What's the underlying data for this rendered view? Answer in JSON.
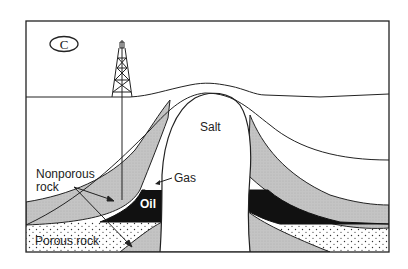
{
  "diagram": {
    "panel_label": "C",
    "labels": {
      "salt": "Salt",
      "gas": "Gas",
      "oil": "Oil",
      "nonporous_rock_line1": "Nonporous",
      "nonporous_rock_line2": "rock",
      "porous_rock": "Porous rock"
    },
    "colors": {
      "outline": "#222222",
      "nonporous_fill": "#c8c8c8",
      "oil_fill": "#111111",
      "porous_fill": "#ffffff",
      "porous_dots": "#333333",
      "background": "#ffffff"
    },
    "components": [
      "oil derrick",
      "surface line",
      "salt dome",
      "nonporous rock layers",
      "oil reservoir",
      "gas cap",
      "porous rock layer"
    ]
  }
}
